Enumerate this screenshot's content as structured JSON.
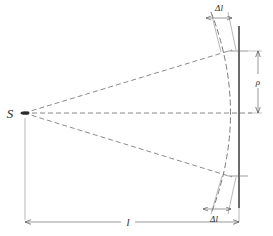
{
  "figure": {
    "type": "optics-geometry-diagram",
    "background_color": "#ffffff",
    "line_color": "#4a4a4a",
    "solid_line_color": "#3a3a3a",
    "text_color": "#2b2b2b",
    "labels": {
      "source_point": "S",
      "radius": "ρ",
      "distance": "l",
      "path_difference_top": "Δl",
      "path_difference_bottom": "Δl"
    },
    "elements": {
      "source_label": "S",
      "axis_style": "dashed",
      "wavefront_style": "dashed-arc",
      "screen_style": "solid-vertical-line",
      "dimension_l_style": "double-arrow-horizontal",
      "dimension_rho_style": "double-arrow-vertical",
      "dimension_dl_style": "double-arrow-slanted"
    },
    "geometry": {
      "source_x": 22,
      "source_y": 113,
      "screen_x": 239,
      "axis_y": 113,
      "arc_apex_x": 239,
      "arc_top_x": 212,
      "arc_top_y": 14,
      "arc_bottom_x": 212,
      "arc_bottom_y": 212,
      "ray_top_end_x": 231,
      "ray_top_end_y": 51,
      "ray_bottom_end_x": 231,
      "ray_bottom_end_y": 176,
      "dimension_l_y": 222,
      "dimension_rho_x": 262
    }
  }
}
